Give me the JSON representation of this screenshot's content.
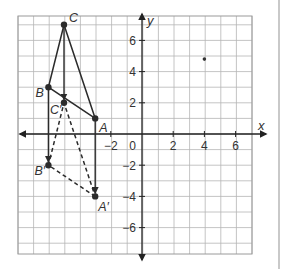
{
  "diagram": {
    "axes": {
      "x_label": "x",
      "y_label": "y",
      "x_range": [
        -8,
        7.5
      ],
      "y_range": [
        -7.8,
        7.5
      ],
      "x_ticks": [
        {
          "value": -2,
          "label": "−2"
        },
        {
          "value": 2,
          "label": "2"
        },
        {
          "value": 4,
          "label": "4"
        },
        {
          "value": 6,
          "label": "6"
        }
      ],
      "y_ticks": [
        {
          "value": 6,
          "label": "6"
        },
        {
          "value": 4,
          "label": "4"
        },
        {
          "value": 2,
          "label": "2"
        },
        {
          "value": -2,
          "label": "−2"
        },
        {
          "value": -4,
          "label": "−4"
        },
        {
          "value": -6,
          "label": "−6"
        }
      ],
      "origin_label": "0",
      "grid": true,
      "grid_range": {
        "x": [
          -8,
          7
        ],
        "y": [
          -7,
          7
        ]
      }
    },
    "preimage": {
      "name": "Triangle ABC",
      "style": "solid",
      "points": [
        {
          "label": "A",
          "x": -3,
          "y": 1
        },
        {
          "label": "B",
          "x": -6,
          "y": 3
        },
        {
          "label": "C",
          "x": -5,
          "y": 7
        }
      ]
    },
    "image": {
      "name": "Triangle A'B'C'",
      "style": "dashed",
      "points": [
        {
          "label": "A′",
          "x": -3,
          "y": -4
        },
        {
          "label": "B′",
          "x": -6,
          "y": -2
        },
        {
          "label": "C′",
          "x": -5,
          "y": 2
        }
      ]
    },
    "translation_arrows": [
      {
        "from": "A",
        "to": "A′"
      },
      {
        "from": "B",
        "to": "B′"
      },
      {
        "from": "C",
        "to": "C′"
      }
    ],
    "stray_mark": {
      "x": 4,
      "y": 4.8
    },
    "colors": {
      "grid": "#b5b5b5",
      "axis": "#222222",
      "figure": "#2b2b2b",
      "text": "#333333",
      "background": "#ffffff"
    }
  }
}
